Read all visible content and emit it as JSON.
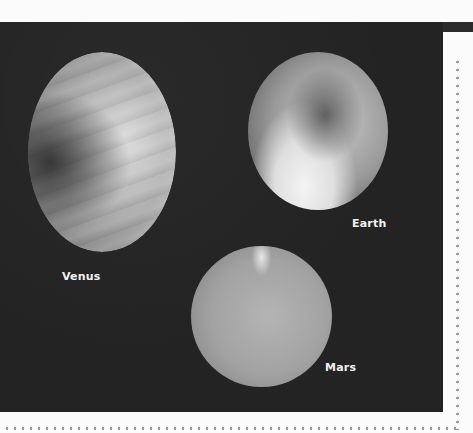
{
  "figure": {
    "colors": {
      "background": "#fbfbfb",
      "photo_background": "#232323",
      "label_text": "#f2f2f2",
      "dotted_border": "#9a9a9a"
    },
    "planets": [
      {
        "name": "Venus",
        "label": "Venus"
      },
      {
        "name": "Earth",
        "label": "Earth"
      },
      {
        "name": "Mars",
        "label": "Mars"
      }
    ]
  }
}
